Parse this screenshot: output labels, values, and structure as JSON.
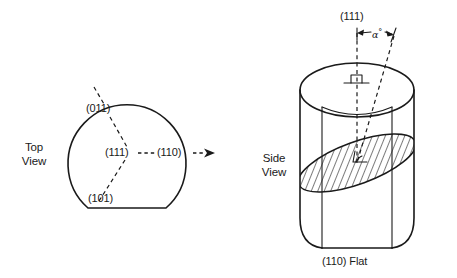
{
  "figure": {
    "type": "crystallographic-wafer-orientation-diagram",
    "background_color": "#ffffff",
    "ink_color": "#1a1a1a"
  },
  "top_view": {
    "view_label_line1": "Top",
    "view_label_line2": "View",
    "plane_labels": {
      "upper_left": "(011)",
      "center": "(111)",
      "right": "(110)",
      "lower_left": "(101)"
    },
    "shape": "circle-with-flat-bottom",
    "has_direction_arrow": true
  },
  "side_view": {
    "view_label_line1": "Side",
    "view_label_line2": "View",
    "top_axis_label": "(111)",
    "angle_label": "α",
    "angle_degree_symbol": "°",
    "bottom_label": "(110) Flat",
    "shape": "cylinder-with-flat",
    "has_hatched_plane": true,
    "has_perpendicular_symbol": true
  }
}
